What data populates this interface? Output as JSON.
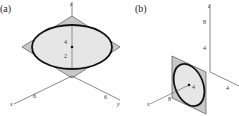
{
  "panels": [
    {
      "label": "(a)",
      "axes": {
        "x": "x",
        "y": "y",
        "z": "z"
      },
      "z_ticks": [
        "4",
        "2"
      ],
      "x_tick": "6",
      "y_tick": "6"
    },
    {
      "label": "(b)",
      "axes": {
        "x": "x",
        "y": "y",
        "z": "z"
      },
      "z_ticks": [
        "8",
        "4"
      ],
      "x_tick": "8",
      "y_tick": "4",
      "center_label": "4"
    }
  ],
  "colors": {
    "plane_fill": "#c8c8c8",
    "ellipse_fill": "#e6e6e6",
    "ellipse_stroke": "#111111",
    "axis": "#555555"
  }
}
